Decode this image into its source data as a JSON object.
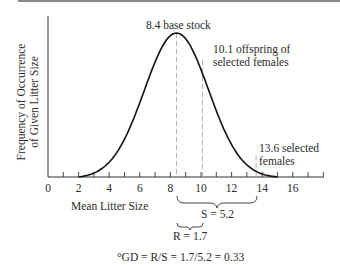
{
  "chart_data": {
    "type": "line",
    "title": "",
    "xlabel": "Mean Litter Size",
    "ylabel_lines": [
      "Frequency of Occurrence",
      "of Given Litter Size"
    ],
    "xlim": [
      0,
      18
    ],
    "x_ticks": [
      0,
      1,
      2,
      3,
      4,
      5,
      6,
      7,
      8,
      9,
      10,
      11,
      12,
      13,
      14,
      15,
      16,
      17,
      18
    ],
    "x_tick_labels": [
      {
        "value": 0,
        "label": "0"
      },
      {
        "value": 2,
        "label": "2"
      },
      {
        "value": 4,
        "label": "4"
      },
      {
        "value": 6,
        "label": "6"
      },
      {
        "value": 8,
        "label": "8"
      },
      {
        "value": 10,
        "label": "10"
      },
      {
        "value": 12,
        "label": "12"
      },
      {
        "value": 14,
        "label": "14"
      },
      {
        "value": 16,
        "label": "16"
      }
    ],
    "series": [
      {
        "name": "litter size distribution",
        "shape": "bell curve",
        "mean": 8.4,
        "x": [
          2,
          3,
          4,
          5,
          6,
          7,
          8,
          8.4,
          9,
          10,
          11,
          12,
          13,
          14,
          15
        ],
        "y": [
          0.0,
          0.1,
          0.25,
          0.45,
          0.7,
          0.9,
          0.99,
          1.0,
          0.97,
          0.82,
          0.6,
          0.38,
          0.2,
          0.08,
          0.0
        ]
      }
    ],
    "reference_lines": [
      {
        "x": 8.4,
        "label": "8.4 base stock",
        "style": "dashed"
      },
      {
        "x": 10.1,
        "label_lines": [
          "10.1 offspring of",
          "selected females"
        ],
        "style": "dashed"
      },
      {
        "x": 13.6,
        "label_lines": [
          "13.6 selected",
          "females"
        ],
        "style": "dashed"
      }
    ],
    "annotations": [
      {
        "type": "brace",
        "from": 8.4,
        "to": 13.6,
        "label": "S = 5.2"
      },
      {
        "type": "brace",
        "from": 8.4,
        "to": 10.1,
        "label": "R = 1.7"
      }
    ],
    "formula": "°GD = R/S = 1.7/5.2 = 0.33",
    "grid": false
  },
  "colors": {
    "curve": "#111111",
    "axis": "#333333",
    "dashed": "#b0b0b0",
    "top_bar": "#8a8a8a",
    "text": "#2a2a2a"
  }
}
